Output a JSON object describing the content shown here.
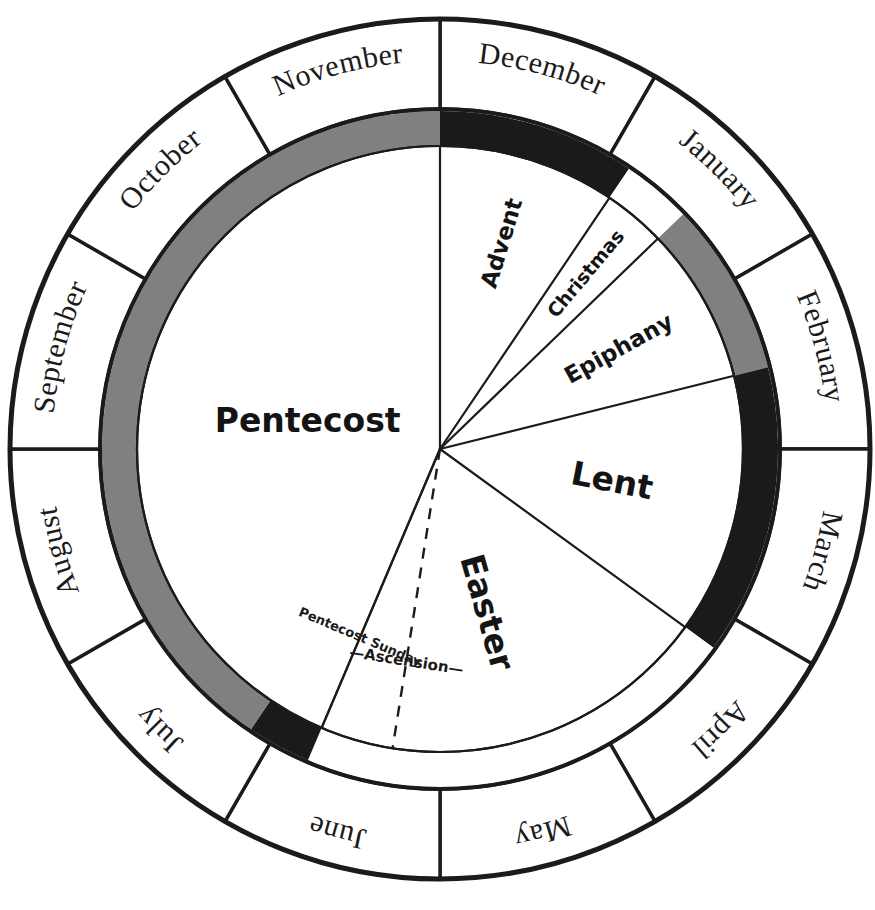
{
  "diagram": {
    "type": "radial-calendar"
  },
  "colors": {
    "outline": "#1b1b1b",
    "background": "#ffffff",
    "band_gray": "#808080",
    "band_dark": "#1a1a1a",
    "text": "#141414"
  },
  "geometry": {
    "center_x": 440,
    "center_y": 449,
    "outer_radius": 430,
    "month_ring_inner_radius": 340,
    "band_ring_outer_radius": 338,
    "band_ring_inner_radius": 303,
    "sector_radius": 303,
    "degrees_per_month": 30,
    "december_start_angle_deg": -90
  },
  "month_ring": {
    "name": "months",
    "months": [
      {
        "label": "December",
        "index": 0,
        "start_deg": -90,
        "end_deg": -60
      },
      {
        "label": "January",
        "index": 1,
        "start_deg": -60,
        "end_deg": -30
      },
      {
        "label": "February",
        "index": 2,
        "start_deg": -30,
        "end_deg": 0
      },
      {
        "label": "March",
        "index": 3,
        "start_deg": 0,
        "end_deg": 30
      },
      {
        "label": "April",
        "index": 4,
        "start_deg": 30,
        "end_deg": 60
      },
      {
        "label": "May",
        "index": 5,
        "start_deg": 60,
        "end_deg": 90
      },
      {
        "label": "June",
        "index": 6,
        "start_deg": 90,
        "end_deg": 120
      },
      {
        "label": "July",
        "index": 7,
        "start_deg": 120,
        "end_deg": 150
      },
      {
        "label": "August",
        "index": 8,
        "start_deg": 150,
        "end_deg": 180
      },
      {
        "label": "September",
        "index": 9,
        "start_deg": 180,
        "end_deg": 210
      },
      {
        "label": "October",
        "index": 10,
        "start_deg": 210,
        "end_deg": 240
      },
      {
        "label": "November",
        "index": 11,
        "start_deg": 240,
        "end_deg": 270
      }
    ]
  },
  "color_band_ring": {
    "name": "liturgical-color-band",
    "segments": [
      {
        "season": "Advent",
        "color_name": "dark",
        "color": "#1a1a1a",
        "start_deg": -90,
        "end_deg": -56
      },
      {
        "season": "Christmas",
        "color_name": "white",
        "color": "#ffffff",
        "start_deg": -56,
        "end_deg": -44
      },
      {
        "season": "Epiphany",
        "color_name": "gray",
        "color": "#808080",
        "start_deg": -44,
        "end_deg": -14
      },
      {
        "season": "Lent",
        "color_name": "dark",
        "color": "#1a1a1a",
        "start_deg": -14,
        "end_deg": 36
      },
      {
        "season": "Easter",
        "color_name": "white",
        "color": "#ffffff",
        "start_deg": 36,
        "end_deg": 113
      },
      {
        "season": "Pentecost Sunday",
        "color_name": "dark",
        "color": "#1a1a1a",
        "start_deg": 113,
        "end_deg": 124
      },
      {
        "season": "Pentecost",
        "color_name": "gray",
        "color": "#808080",
        "start_deg": 124,
        "end_deg": 270
      }
    ]
  },
  "season_sectors": {
    "name": "liturgical-seasons",
    "sectors": [
      {
        "label": "Advent",
        "start_deg": -90,
        "end_deg": -56,
        "label_radius": 215,
        "label_rotation": -73,
        "size": "medium"
      },
      {
        "label": "Christmas",
        "start_deg": -56,
        "end_deg": -44,
        "label_radius": 228,
        "label_rotation": -50,
        "size": "small"
      },
      {
        "label": "Epiphany",
        "start_deg": -44,
        "end_deg": -14,
        "label_radius": 205,
        "label_rotation": -29,
        "size": "medium"
      },
      {
        "label": "Lent",
        "start_deg": -14,
        "end_deg": 36,
        "label_radius": 175,
        "label_rotation": 11,
        "size": "large"
      },
      {
        "label": "Easter",
        "start_deg": 36,
        "end_deg": 113,
        "label_radius": 170,
        "label_rotation": 74,
        "size": "large"
      },
      {
        "label": "Pentecost",
        "start_deg": 113,
        "end_deg": 270,
        "label_radius": 135,
        "label_rotation": 0,
        "size": "large"
      }
    ]
  },
  "event_markers": {
    "name": "event-markers",
    "markers": [
      {
        "label": "—Ascension—",
        "angle_deg": 99,
        "style": "dashed",
        "label_radius": 215,
        "label_rotation": 99
      },
      {
        "label": "Pentecost Sunday",
        "angle_deg": 113,
        "style": "solid",
        "label_radius": 205,
        "label_rotation": 113
      }
    ]
  },
  "chart_data": {
    "type": "pie",
    "categories": [
      "Advent",
      "Christmas",
      "Epiphany",
      "Lent",
      "Easter",
      "Pentecost"
    ],
    "values": [
      34,
      12,
      30,
      50,
      77,
      157
    ],
    "unit": "degrees",
    "rings": [
      {
        "name": "months",
        "labels": [
          "December",
          "January",
          "February",
          "March",
          "April",
          "May",
          "June",
          "July",
          "August",
          "September",
          "October",
          "November"
        ],
        "values": [
          30,
          30,
          30,
          30,
          30,
          30,
          30,
          30,
          30,
          30,
          30,
          30
        ]
      },
      {
        "name": "liturgical-colors",
        "labels": [
          "Advent",
          "Christmas",
          "Epiphany",
          "Lent",
          "Easter",
          "Pentecost Sunday",
          "Pentecost"
        ],
        "values": [
          34,
          12,
          30,
          50,
          77,
          11,
          146
        ],
        "colors": [
          "#1a1a1a",
          "#ffffff",
          "#808080",
          "#1a1a1a",
          "#ffffff",
          "#1a1a1a",
          "#808080"
        ]
      }
    ],
    "annotations": [
      "—Ascension—",
      "Pentecost Sunday"
    ],
    "legend": "none",
    "grid": false
  }
}
